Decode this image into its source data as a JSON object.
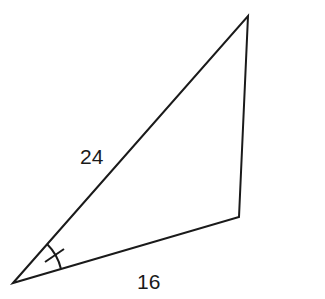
{
  "diagram": {
    "type": "triangle",
    "vertices": {
      "A": {
        "x": 13,
        "y": 283
      },
      "B": {
        "x": 248,
        "y": 16
      },
      "C": {
        "x": 239,
        "y": 217
      }
    },
    "sides": [
      {
        "between": [
          "A",
          "B"
        ],
        "label": "24"
      },
      {
        "between": [
          "A",
          "C"
        ],
        "label": "16"
      }
    ],
    "angle_mark": {
      "vertex": "A",
      "style": "arc-with-single-tick"
    },
    "stroke_color": "#1a1a1a",
    "background": "#ffffff"
  }
}
